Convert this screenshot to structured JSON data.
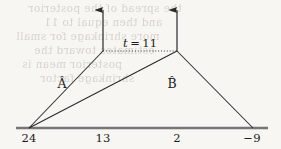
{
  "figure": {
    "caption_visible": false,
    "background_color": "#f7f6f2",
    "ink_color": "#2a2a2a",
    "axis": {
      "name": "number-line",
      "y": 128,
      "x_start": 16,
      "x_end": 268,
      "color": "#6f6f6f",
      "thickness": 2.2,
      "ticks": [
        {
          "label": "24",
          "x": 29
        },
        {
          "label": "13",
          "x": 103
        },
        {
          "label": "2",
          "x": 177
        },
        {
          "label": "−9",
          "x": 252
        }
      ]
    },
    "vertical_arrows": [
      {
        "name": "arrow-left",
        "x": 103,
        "y_base": 51,
        "y_tip": 9
      },
      {
        "name": "arrow-right",
        "x": 177,
        "y_base": 51,
        "y_tip": 9
      }
    ],
    "dotted_level_line": {
      "label": "t = 11",
      "label_value": "11",
      "label_var": "t",
      "label_eq": "=",
      "label_x": 140,
      "label_y": 38,
      "y": 51,
      "x_start": 103,
      "x_end": 178
    },
    "apex_left": {
      "x": 103,
      "y": 51
    },
    "apex_right": {
      "x": 177,
      "y": 51
    },
    "origin_point": {
      "x": 29,
      "y": 128
    },
    "right_foot": {
      "x": 253,
      "y": 128
    },
    "segments": [
      {
        "name": "segment-origin-to-left-apex",
        "x1": 29,
        "y1": 128,
        "x2": 103,
        "y2": 51
      },
      {
        "name": "segment-origin-to-right-apex",
        "x1": 29,
        "y1": 128,
        "x2": 177,
        "y2": 51
      },
      {
        "name": "segment-right-apex-to-foot",
        "x1": 177,
        "y1": 51,
        "x2": 253,
        "y2": 128
      }
    ],
    "estimator_labels": [
      {
        "name": "label-a-hat",
        "text": "Â",
        "x": 62,
        "y": 78
      },
      {
        "name": "label-b-hat",
        "text": "B̂",
        "x": 172,
        "y": 78
      }
    ]
  },
  "bleed_through": {
    "visible": true,
    "description": "faint mirrored text showing through from reverse side of scanned page",
    "lines": [
      {
        "text": "the spread of the posterior",
        "x": 28,
        "y": 2
      },
      {
        "text": "and then equal to 11",
        "x": 44,
        "y": 16
      },
      {
        "text": "more shrinkage for small",
        "x": 16,
        "y": 30
      },
      {
        "text": "estimates toward the",
        "x": 34,
        "y": 44
      },
      {
        "text": "posterior mean is",
        "x": 22,
        "y": 58
      },
      {
        "text": "shrinkage factor",
        "x": 40,
        "y": 72
      }
    ]
  }
}
